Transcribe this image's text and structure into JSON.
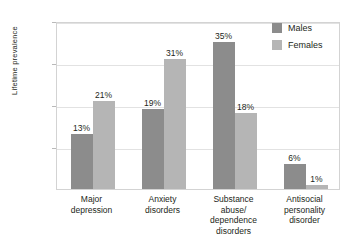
{
  "chart_data": {
    "type": "bar",
    "title": "",
    "xlabel": "",
    "ylabel": "Lifetime prevalence",
    "ylim": [
      0,
      40
    ],
    "yticks": [
      "10",
      "20",
      "30",
      "40%"
    ],
    "grid": true,
    "legend_position": "top-right",
    "categories": [
      "Major\ndepression",
      "Anxiety\ndisorders",
      "Substance\nabuse/\ndependence\ndisorders",
      "Antisocial\npersonality\ndisorder"
    ],
    "series": [
      {
        "name": "Males",
        "color": "#8c8c8c",
        "values": [
          13,
          19,
          35,
          6
        ],
        "labels": [
          "13%",
          "19%",
          "35%",
          "6%"
        ]
      },
      {
        "name": "Females",
        "color": "#b5b5b5",
        "values": [
          21,
          31,
          18,
          1
        ],
        "labels": [
          "21%",
          "31%",
          "18%",
          "1%"
        ]
      }
    ]
  },
  "axis": {
    "y_label": "Lifetime prevalence",
    "y_ticks": [
      {
        "label": "40%",
        "value": 40
      },
      {
        "label": "30",
        "value": 30
      },
      {
        "label": "20",
        "value": 20
      },
      {
        "label": "10",
        "value": 10
      }
    ],
    "categories": [
      {
        "lines": [
          "Major",
          "depression"
        ]
      },
      {
        "lines": [
          "Anxiety",
          "disorders"
        ]
      },
      {
        "lines": [
          "Substance",
          "abuse/",
          "dependence",
          "disorders"
        ]
      },
      {
        "lines": [
          "Antisocial",
          "personality",
          "disorder"
        ]
      }
    ]
  },
  "legend": {
    "items": [
      {
        "label": "Males",
        "color": "#8c8c8c"
      },
      {
        "label": "Females",
        "color": "#b5b5b5"
      }
    ]
  },
  "top_caption": ""
}
